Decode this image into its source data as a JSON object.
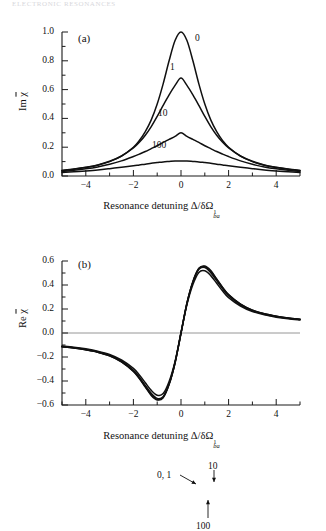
{
  "running_head": "ELECTRONIC RESONANCES",
  "figure": {
    "panels": [
      {
        "tag": "(a)",
        "ylabel_prefix": "Im ",
        "ylabel_symbol": "χ",
        "xlabel_prefix": "Resonance detuning ",
        "xlabel_symbol": "Δ/δΩ",
        "xlabel_sup": "1",
        "xlabel_sub": "ba",
        "ytick_labels": [
          "1.0",
          "0.8",
          "0.6",
          "0.4",
          "0.2",
          "0.0"
        ],
        "xtick_labels": [
          "−4",
          "−2",
          "0",
          "2",
          "4"
        ],
        "curve_labels": [
          {
            "text": "0",
            "x": 195,
            "y": 33
          },
          {
            "text": "1",
            "x": 170,
            "y": 62
          },
          {
            "text": "10",
            "x": 158,
            "y": 108
          },
          {
            "text": "100",
            "x": 152,
            "y": 140
          }
        ]
      },
      {
        "tag": "(b)",
        "ylabel_prefix": "Re ",
        "ylabel_symbol": "χ",
        "xlabel_prefix": "Resonance detuning ",
        "xlabel_symbol": "Δ/δΩ",
        "xlabel_sup": "1",
        "xlabel_sub": "ba",
        "ytick_labels": [
          "0.6",
          "0.4",
          "0.2",
          "0.0",
          "−0.2",
          "−0.4",
          "−0.6"
        ],
        "xtick_labels": [
          "−4",
          "−2",
          "0",
          "2",
          "4"
        ],
        "curve_labels": [
          {
            "text": "0, 1",
            "x": 157,
            "y": 245
          },
          {
            "text": "10",
            "x": 208,
            "y": 236
          },
          {
            "text": "100",
            "x": 196,
            "y": 296
          }
        ]
      }
    ]
  },
  "chart_data": [
    {
      "type": "line",
      "panel": "(a)",
      "title": "",
      "xlabel": "Resonance detuning Δ/δΩ¹_ba",
      "ylabel": "Im χ̄",
      "xlim": [
        -5,
        5
      ],
      "ylim": [
        0.0,
        1.0
      ],
      "xticks": [
        -4,
        -2,
        0,
        2,
        4
      ],
      "xminorticks": [
        -5,
        -3,
        -1,
        1,
        3,
        5
      ],
      "yticks": [
        0.0,
        0.2,
        0.4,
        0.6,
        0.8,
        1.0
      ],
      "yminorticks": [
        0.1,
        0.3,
        0.5,
        0.7,
        0.9
      ],
      "grid": false,
      "legend": "inline-curve-labels",
      "series": [
        {
          "name": "0",
          "peak": 1.0,
          "hwhm": 1.0,
          "x": [
            -5,
            -4.5,
            -4,
            -3.5,
            -3,
            -2.5,
            -2,
            -1.75,
            -1.5,
            -1.25,
            -1,
            -0.75,
            -0.5,
            -0.25,
            0,
            0.25,
            0.5,
            0.75,
            1,
            1.25,
            1.5,
            1.75,
            2,
            2.5,
            3,
            3.5,
            4,
            4.5,
            5
          ],
          "y": [
            0.038,
            0.047,
            0.059,
            0.075,
            0.1,
            0.138,
            0.2,
            0.246,
            0.308,
            0.39,
            0.5,
            0.64,
            0.8,
            0.941,
            1.0,
            0.941,
            0.8,
            0.64,
            0.5,
            0.39,
            0.308,
            0.246,
            0.2,
            0.138,
            0.1,
            0.075,
            0.059,
            0.047,
            0.038
          ]
        },
        {
          "name": "1",
          "peak": 0.68,
          "hwhm": 1.22,
          "x": [
            -5,
            -4.5,
            -4,
            -3.5,
            -3,
            -2.5,
            -2,
            -1.75,
            -1.5,
            -1.25,
            -1,
            -0.75,
            -0.5,
            -0.25,
            0,
            0.25,
            0.5,
            0.75,
            1,
            1.25,
            1.5,
            1.75,
            2,
            2.5,
            3,
            3.5,
            4,
            4.5,
            5
          ],
          "y": [
            0.039,
            0.048,
            0.06,
            0.077,
            0.102,
            0.139,
            0.195,
            0.234,
            0.283,
            0.343,
            0.414,
            0.49,
            0.563,
            0.629,
            0.68,
            0.629,
            0.563,
            0.49,
            0.414,
            0.343,
            0.283,
            0.234,
            0.195,
            0.139,
            0.102,
            0.077,
            0.06,
            0.048,
            0.039
          ]
        },
        {
          "name": "10",
          "peak": 0.3,
          "hwhm": 1.75,
          "x": [
            -5,
            -4.5,
            -4,
            -3.5,
            -3,
            -2.5,
            -2,
            -1.75,
            -1.5,
            -1.25,
            -1,
            -0.75,
            -0.5,
            -0.25,
            0,
            0.25,
            0.5,
            0.75,
            1,
            1.25,
            1.5,
            1.75,
            2,
            2.5,
            3,
            3.5,
            4,
            4.5,
            5
          ],
          "y": [
            0.032,
            0.04,
            0.05,
            0.063,
            0.081,
            0.105,
            0.135,
            0.152,
            0.17,
            0.19,
            0.21,
            0.233,
            0.254,
            0.275,
            0.3,
            0.275,
            0.254,
            0.233,
            0.21,
            0.19,
            0.17,
            0.152,
            0.135,
            0.105,
            0.081,
            0.063,
            0.05,
            0.04,
            0.032
          ]
        },
        {
          "name": "100",
          "peak": 0.105,
          "hwhm": 2.55,
          "x": [
            -5,
            -4.5,
            -4,
            -3.5,
            -3,
            -2.5,
            -2,
            -1.75,
            -1.5,
            -1.25,
            -1,
            -0.75,
            -0.5,
            -0.25,
            0,
            0.25,
            0.5,
            0.75,
            1,
            1.25,
            1.5,
            1.75,
            2,
            2.5,
            3,
            3.5,
            4,
            4.5,
            5
          ],
          "y": [
            0.024,
            0.029,
            0.035,
            0.042,
            0.051,
            0.061,
            0.071,
            0.077,
            0.082,
            0.088,
            0.093,
            0.098,
            0.101,
            0.104,
            0.105,
            0.104,
            0.101,
            0.098,
            0.093,
            0.088,
            0.082,
            0.077,
            0.071,
            0.061,
            0.051,
            0.042,
            0.035,
            0.029,
            0.024
          ]
        }
      ]
    },
    {
      "type": "line",
      "panel": "(b)",
      "title": "",
      "xlabel": "Resonance detuning Δ/δΩ¹_ba",
      "ylabel": "Re χ̄",
      "xlim": [
        -5,
        5
      ],
      "ylim": [
        -0.6,
        0.6
      ],
      "xticks": [
        -4,
        -2,
        0,
        2,
        4
      ],
      "xminorticks": [
        -5,
        -3,
        -1,
        1,
        3,
        5
      ],
      "yticks": [
        -0.6,
        -0.4,
        -0.2,
        0.0,
        0.2,
        0.4,
        0.6
      ],
      "yminorticks": [
        -0.5,
        -0.3,
        -0.1,
        0.1,
        0.3,
        0.5
      ],
      "grid": false,
      "zero_line": true,
      "legend": "inline-curve-labels-with-arrows",
      "series": [
        {
          "name": "0",
          "x": [
            -5,
            -4.5,
            -4,
            -3.5,
            -3,
            -2.5,
            -2,
            -1.75,
            -1.5,
            -1.25,
            -1,
            -0.75,
            -0.5,
            -0.25,
            0,
            0.25,
            0.5,
            0.75,
            1,
            1.25,
            1.5,
            1.75,
            2,
            2.5,
            3,
            3.5,
            4,
            4.5,
            5
          ],
          "y": [
            -0.115,
            -0.125,
            -0.14,
            -0.16,
            -0.19,
            -0.24,
            -0.32,
            -0.38,
            -0.45,
            -0.52,
            -0.558,
            -0.54,
            -0.43,
            -0.25,
            0.0,
            0.25,
            0.43,
            0.54,
            0.558,
            0.52,
            0.45,
            0.38,
            0.32,
            0.24,
            0.19,
            0.16,
            0.14,
            0.125,
            0.115
          ]
        },
        {
          "name": "1",
          "x": [
            -5,
            -4.5,
            -4,
            -3.5,
            -3,
            -2.5,
            -2,
            -1.75,
            -1.5,
            -1.25,
            -1,
            -0.75,
            -0.5,
            -0.25,
            0,
            0.25,
            0.5,
            0.75,
            1,
            1.25,
            1.5,
            1.75,
            2,
            2.5,
            3,
            3.5,
            4,
            4.5,
            5
          ],
          "y": [
            -0.115,
            -0.125,
            -0.14,
            -0.16,
            -0.19,
            -0.24,
            -0.318,
            -0.377,
            -0.446,
            -0.514,
            -0.552,
            -0.535,
            -0.426,
            -0.248,
            0.0,
            0.248,
            0.426,
            0.535,
            0.552,
            0.514,
            0.446,
            0.377,
            0.318,
            0.24,
            0.19,
            0.16,
            0.14,
            0.125,
            0.115
          ]
        },
        {
          "name": "10",
          "x": [
            -5,
            -4.5,
            -4,
            -3.5,
            -3,
            -2.5,
            -2,
            -1.75,
            -1.5,
            -1.25,
            -1,
            -0.75,
            -0.5,
            -0.25,
            0,
            0.25,
            0.5,
            0.75,
            1,
            1.25,
            1.5,
            1.75,
            2,
            2.5,
            3,
            3.5,
            4,
            4.5,
            5
          ],
          "y": [
            -0.112,
            -0.122,
            -0.137,
            -0.157,
            -0.186,
            -0.234,
            -0.31,
            -0.368,
            -0.436,
            -0.503,
            -0.545,
            -0.53,
            -0.423,
            -0.246,
            0.0,
            0.246,
            0.423,
            0.53,
            0.545,
            0.503,
            0.436,
            0.368,
            0.31,
            0.234,
            0.186,
            0.157,
            0.137,
            0.122,
            0.112
          ]
        },
        {
          "name": "100",
          "x": [
            -5,
            -4.5,
            -4,
            -3.5,
            -3,
            -2.5,
            -2,
            -1.75,
            -1.5,
            -1.25,
            -1,
            -0.75,
            -0.5,
            -0.25,
            0,
            0.25,
            0.5,
            0.75,
            1,
            1.25,
            1.5,
            1.75,
            2,
            2.5,
            3,
            3.5,
            4,
            4.5,
            5
          ],
          "y": [
            -0.108,
            -0.118,
            -0.132,
            -0.151,
            -0.179,
            -0.225,
            -0.295,
            -0.35,
            -0.414,
            -0.478,
            -0.518,
            -0.505,
            -0.404,
            -0.236,
            0.0,
            0.236,
            0.404,
            0.505,
            0.518,
            0.478,
            0.414,
            0.35,
            0.295,
            0.225,
            0.179,
            0.151,
            0.132,
            0.118,
            0.108
          ]
        }
      ]
    }
  ]
}
